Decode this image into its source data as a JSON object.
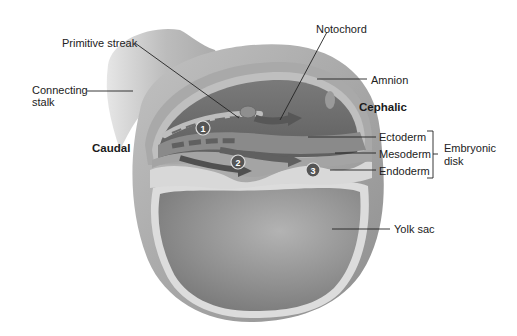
{
  "diagram": {
    "type": "anatomical-illustration",
    "labels": {
      "primitive_streak": "Primitive streak",
      "notochord": "Notochord",
      "connecting_stalk_line1": "Connecting",
      "connecting_stalk_line2": "stalk",
      "amnion": "Amnion",
      "cephalic": "Cephalic",
      "caudal": "Caudal",
      "ectoderm": "Ectoderm",
      "mesoderm": "Mesoderm",
      "endoderm": "Endoderm",
      "embryonic_disk_line1": "Embryonic",
      "embryonic_disk_line2": "disk",
      "yolk_sac": "Yolk sac"
    },
    "step_markers": [
      {
        "number": "1",
        "x": 203,
        "y": 128
      },
      {
        "number": "2",
        "x": 238,
        "y": 162
      },
      {
        "number": "3",
        "x": 313,
        "y": 170
      }
    ],
    "bracket": {
      "groups": [
        "Ectoderm",
        "Mesoderm",
        "Endoderm"
      ],
      "label": "Embryonic disk"
    },
    "colors": {
      "outer_membrane": "#9a9a9a",
      "stalk": "#b4b4b4",
      "amniotic_cavity": "#6e6e6e",
      "ectoderm": "#8a8a8a",
      "mesoderm": "#a8a8a8",
      "endoderm": "#d8d8d8",
      "yolk_sac": "#8c8c8c",
      "yolk_lining": "#dcdcdc",
      "arrows": "#555555",
      "marker_fill": "#555555",
      "leader_lines": "#222222"
    }
  }
}
